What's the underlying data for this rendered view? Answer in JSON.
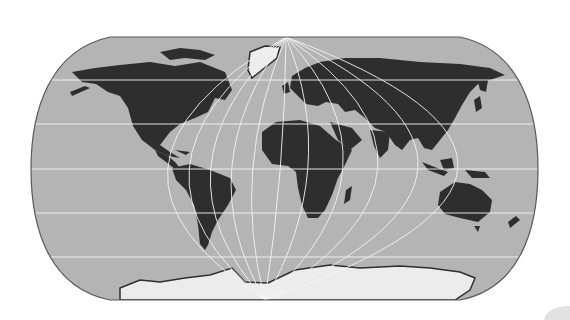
{
  "map": {
    "title": "World map",
    "projection": "pseudo-cylindrical (rounded-rectangle outline)",
    "colors": {
      "background": "#ffffff",
      "ocean": "#b4b4b4",
      "land": "#2e2e2e",
      "ice": "#ececec",
      "graticule": "#f4f4f4",
      "outline": "#5a5a5a"
    },
    "graticule": {
      "parallels_y": [
        80,
        124,
        169,
        213,
        257
      ],
      "meridians_equator_x": [
        73,
        116,
        159,
        201,
        243,
        285,
        327,
        369,
        411,
        453,
        495
      ],
      "north_apex": [
        286,
        37
      ],
      "south_apex": [
        265,
        300
      ]
    },
    "bounds": {
      "left": 31,
      "right": 538,
      "top": 37,
      "bottom": 300
    },
    "regions": [
      "North America",
      "Greenland",
      "South America",
      "Europe",
      "Africa",
      "Asia",
      "Australia",
      "New Zealand",
      "Antarctica",
      "Madagascar",
      "Indonesia"
    ]
  }
}
